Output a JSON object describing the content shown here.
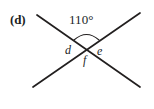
{
  "figure": {
    "part_label": "(d)",
    "background_color": "#ffffff",
    "stroke_color": "#221f1f",
    "text_color": "#221f1f",
    "width": 154,
    "height": 109,
    "angle_measure": "110°",
    "angle_names": {
      "left": "d",
      "right": "e",
      "bottom": "f"
    },
    "intersection": {
      "x": 86,
      "y": 48
    },
    "lines": [
      {
        "name": "line-descending",
        "x1": 37,
        "y1": 15,
        "x2": 140,
        "y2": 87
      },
      {
        "name": "line-ascending",
        "x1": 33,
        "y1": 87,
        "x2": 140,
        "y2": 13
      }
    ],
    "arc": {
      "name": "angle-arc",
      "start_x": 74,
      "start_y": 40,
      "end_x": 99,
      "end_y": 40,
      "apex_y": 29
    }
  }
}
